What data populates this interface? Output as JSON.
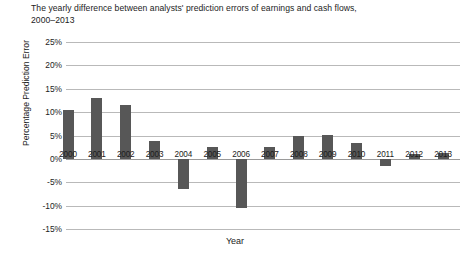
{
  "figure": {
    "title": "The yearly difference between analysts' prediction errors of earnings and cash flows,\n2000–2013",
    "background_color": "#ffffff",
    "bar_color": "#575757",
    "gridline_color": "#b9b9b9"
  },
  "chart_data": {
    "type": "bar",
    "title": "The yearly difference between analysts' prediction errors of earnings and cash flows, 2000–2013",
    "xlabel": "Year",
    "ylabel": "Percentage Prediction Error",
    "categories": [
      "2000",
      "2001",
      "2002",
      "2003",
      "2004",
      "2005",
      "2006",
      "2007",
      "2008",
      "2009",
      "2010",
      "2011",
      "2012",
      "2013"
    ],
    "values": [
      10.5,
      13.0,
      11.5,
      3.8,
      -6.5,
      2.5,
      -10.5,
      2.5,
      5.0,
      5.2,
      3.5,
      -1.5,
      1.0,
      1.2
    ],
    "value_unit": "%",
    "ylim": [
      -15,
      25
    ],
    "ytick_values": [
      25,
      20,
      15,
      10,
      5,
      0,
      -5,
      -10,
      -15
    ],
    "ytick_labels": [
      "25%",
      "20%",
      "15%",
      "10%",
      "5%",
      "0%",
      "-5%",
      "-10%",
      "-15%"
    ],
    "grid": "horizontal",
    "legend": "none",
    "series": [
      {
        "name": "Difference in prediction error",
        "values": [
          10.5,
          13.0,
          11.5,
          3.8,
          -6.5,
          2.5,
          -10.5,
          2.5,
          5.0,
          5.2,
          3.5,
          -1.5,
          1.0,
          1.2
        ]
      }
    ]
  }
}
